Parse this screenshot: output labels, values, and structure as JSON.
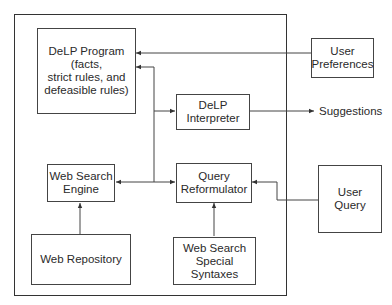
{
  "diagram": {
    "system_frame": "system-boundary",
    "boxes": {
      "delp_program": "DeLP Program\n(facts,\nstrict rules, and\ndefeasible rules)",
      "delp_interpreter": "DeLP\nInterpreter",
      "web_search_engine": "Web Search\nEngine",
      "query_reformulator": "Query\nReformulator",
      "web_repository": "Web Repository",
      "web_search_special_syntaxes": "Web Search\nSpecial\nSyntaxes",
      "user_preferences": "User\nPreferences",
      "user_query": "User\nQuery"
    },
    "output_label": "Suggestions",
    "colors": {
      "line": "#444444",
      "text": "#2a2a2a",
      "background": "#ffffff"
    },
    "edges": [
      {
        "from": "User Preferences",
        "to": "DeLP Program"
      },
      {
        "from": "Web Search Engine / Query Reformulator junction",
        "to": "DeLP Program"
      },
      {
        "from": "junction",
        "to": "DeLP Interpreter"
      },
      {
        "from": "DeLP Interpreter",
        "to": "Suggestions"
      },
      {
        "from": "junction",
        "to": "Web Search Engine"
      },
      {
        "from": "junction",
        "to": "Query Reformulator"
      },
      {
        "from": "Web Repository",
        "to": "Web Search Engine"
      },
      {
        "from": "Web Search Special Syntaxes",
        "to": "Query Reformulator"
      },
      {
        "from": "User Query",
        "to": "Query Reformulator"
      }
    ]
  }
}
